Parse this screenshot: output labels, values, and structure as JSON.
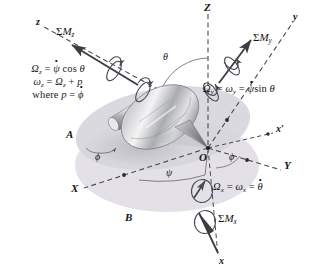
{
  "figure": {
    "background_color": "#ffffff",
    "plane_fill": "#d9d7de",
    "plane_fill_light": "#e6e4ea",
    "line_color": "#4a4a52",
    "metal_light": "#f2f2f3",
    "metal_mid": "#b9babd",
    "metal_dark": "#7e8084"
  },
  "axes": {
    "Z": "Z",
    "Y": "Y",
    "X": "X",
    "x_prime": "x′",
    "y_body": "y",
    "z_body": "z",
    "x_body": "x"
  },
  "planes": {
    "upper": "A",
    "lower": "B"
  },
  "origin": {
    "label": "O"
  },
  "angles": {
    "theta": "θ",
    "phi_left": "ϕ",
    "phi_mid": "ϕ",
    "psi": "ψ"
  },
  "moments": {
    "Mz": {
      "sigma": "Σ",
      "M": "M",
      "sub": "z"
    },
    "My": {
      "sigma": "Σ",
      "M": "M",
      "sub": "y"
    },
    "Mx": {
      "sigma": "Σ",
      "M": "M",
      "sub": "x"
    }
  },
  "equations": {
    "z_block": {
      "line1": {
        "lhs_sym": "Ω",
        "lhs_sub": "z",
        "eq": "=",
        "rhs_var": "ψ",
        "rhs_fn": "cos",
        "rhs_arg": "θ"
      },
      "line2": {
        "lhs_sym": "ω",
        "lhs_sub": "z",
        "eq": "=",
        "rhs_sym": "Ω",
        "rhs_sub": "z",
        "plus": "+",
        "rhs_p": "p"
      },
      "line3": {
        "where": "where",
        "p": "p",
        "eq": "=",
        "phi": "ϕ"
      }
    },
    "y_line": {
      "lhs_sym": "Ω",
      "lhs_sub": "y",
      "eq1": "=",
      "mid_sym": "ω",
      "mid_sub": "y",
      "eq2": "=",
      "rhs_var": "ψ",
      "rhs_fn": "sin",
      "rhs_arg": "θ"
    },
    "x_line": {
      "lhs_sym": "Ω",
      "lhs_sub": "x",
      "eq1": "=",
      "mid_sym": "ω",
      "mid_sub": "x",
      "eq2": "=",
      "rhs_var": "θ"
    }
  }
}
